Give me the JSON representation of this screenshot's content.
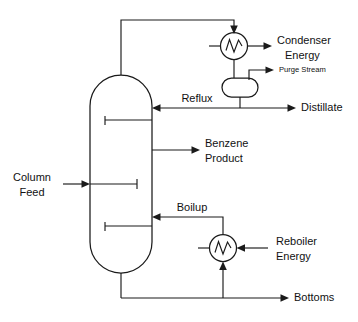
{
  "diagram": {
    "type": "process-flow-diagram",
    "colors": {
      "line": "#1a1a1a",
      "background": "#ffffff",
      "text": "#111111"
    },
    "equipment": [
      {
        "id": "column",
        "name": "distillation-column",
        "shape": "vertical-vessel-rounded-ends"
      },
      {
        "id": "condenser",
        "name": "condenser-heat-exchanger",
        "shape": "circle-with-zigzag"
      },
      {
        "id": "reflux-drum",
        "name": "reflux-drum",
        "shape": "horizontal-rounded-vessel"
      },
      {
        "id": "reboiler",
        "name": "reboiler-heat-exchanger",
        "shape": "circle-with-zigzag"
      }
    ],
    "trays": [
      {
        "id": "tray-top",
        "name": "upper-tray"
      },
      {
        "id": "tray-middle",
        "name": "middle-tray"
      },
      {
        "id": "tray-lower",
        "name": "lower-tray"
      }
    ],
    "labels": {
      "condenser_energy_line1": "Condenser",
      "condenser_energy_line2": "Energy",
      "purge_stream": "Purge Stream",
      "distillate": "Distillate",
      "reflux": "Reflux",
      "benzene_product_line1": "Benzene",
      "benzene_product_line2": "Product",
      "column_feed_line1": "Column",
      "column_feed_line2": "Feed",
      "boilup": "Boilup",
      "reboiler_energy_line1": "Reboiler",
      "reboiler_energy_line2": "Energy",
      "bottoms": "Bottoms"
    },
    "streams": [
      {
        "id": "column-feed",
        "label": "Column Feed",
        "direction": "into-column-left"
      },
      {
        "id": "overhead-vapor",
        "label": "",
        "direction": "column-top-to-condenser"
      },
      {
        "id": "condenser-energy",
        "label": "Condenser Energy",
        "direction": "out-right"
      },
      {
        "id": "purge-stream",
        "label": "Purge Stream",
        "direction": "out-right"
      },
      {
        "id": "distillate",
        "label": "Distillate",
        "direction": "out-right"
      },
      {
        "id": "reflux",
        "label": "Reflux",
        "direction": "into-column-right"
      },
      {
        "id": "benzene-product",
        "label": "Benzene Product",
        "direction": "out-right-sidedraw"
      },
      {
        "id": "boilup",
        "label": "Boilup",
        "direction": "into-column-right"
      },
      {
        "id": "reboiler-energy",
        "label": "Reboiler Energy",
        "direction": "into-reboiler-left"
      },
      {
        "id": "bottoms",
        "label": "Bottoms",
        "direction": "out-right"
      }
    ]
  }
}
